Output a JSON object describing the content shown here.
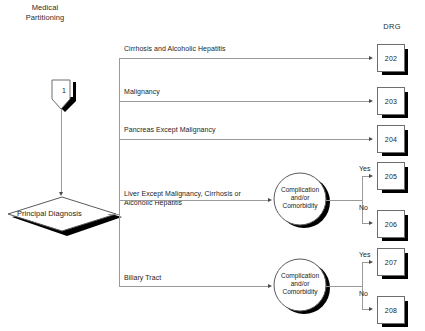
{
  "title": "Medical\nPartitioning",
  "column_header": "DRG",
  "start_node": {
    "label": "1",
    "shape": "pentagon-connector"
  },
  "decision_node": {
    "label": "Principal Diagnosis",
    "shape": "diamond"
  },
  "branches": [
    {
      "label": "Cirrhosis and Alcoholic Hepatitis",
      "target": "202"
    },
    {
      "label": "Malignancy",
      "target": "203"
    },
    {
      "label": "Pancreas Except Malignancy",
      "target": "204"
    },
    {
      "label": "Liver Except Malignancy, Cirrhosis or\nAlcoholic Hepatitis",
      "target": "cc-1"
    },
    {
      "label": "Biliary Tract",
      "target": "cc-2"
    }
  ],
  "cc_nodes": [
    {
      "id": "cc-1",
      "label": "Complication\nand/or\nComorbidity",
      "yes_label": "Yes",
      "no_label": "No",
      "yes_target": "205",
      "no_target": "206"
    },
    {
      "id": "cc-2",
      "label": "Complication\nand/or\nComorbidity",
      "yes_label": "Yes",
      "no_label": "No",
      "yes_target": "207",
      "no_target": "208"
    }
  ],
  "drg_boxes": [
    {
      "code": "202"
    },
    {
      "code": "203"
    },
    {
      "code": "204"
    },
    {
      "code": "205"
    },
    {
      "code": "206"
    },
    {
      "code": "207"
    },
    {
      "code": "208"
    }
  ],
  "drg_box_8": {
    "code": "208"
  },
  "colors": {
    "line": "#9a9a9a",
    "shape_stroke": "#6e6e6e",
    "shadow": "#000000",
    "text": "#1c1c1c",
    "background": "#ffffff"
  }
}
